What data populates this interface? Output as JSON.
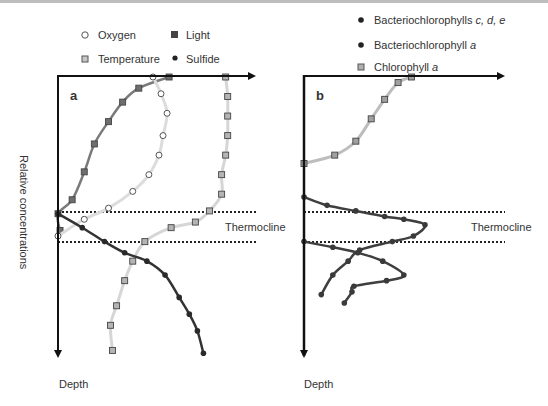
{
  "chart_data": [
    {
      "type": "line",
      "panel_label": "a",
      "xlabel": "Relative concentrations",
      "ylabel": "Depth",
      "annotation": "Thermocline",
      "thermocline_depth_range": [
        0.49,
        0.59
      ],
      "x_range": [
        0,
        1
      ],
      "y_range": [
        0,
        1
      ],
      "legend": [
        {
          "name": "Oxygen",
          "marker": "open-circle"
        },
        {
          "name": "Light",
          "marker": "filled-square"
        },
        {
          "name": "Temperature",
          "marker": "light-square"
        },
        {
          "name": "Sulfide",
          "marker": "filled-circle"
        }
      ],
      "series": [
        {
          "name": "Light",
          "color": "#6e6e6e",
          "line_color": "#7a7a7a",
          "marker": "filled-square",
          "points": [
            [
              0.55,
              0.0
            ],
            [
              0.4,
              0.04
            ],
            [
              0.32,
              0.09
            ],
            [
              0.25,
              0.16
            ],
            [
              0.18,
              0.24
            ],
            [
              0.13,
              0.34
            ],
            [
              0.07,
              0.44
            ],
            [
              0.0,
              0.49
            ],
            [
              0.01,
              0.55
            ]
          ]
        },
        {
          "name": "Oxygen",
          "color": "#ffffff",
          "line_color": "#dcdcdc",
          "marker": "open-circle",
          "points": [
            [
              0.47,
              0.0
            ],
            [
              0.51,
              0.06
            ],
            [
              0.54,
              0.13
            ],
            [
              0.52,
              0.21
            ],
            [
              0.5,
              0.28
            ],
            [
              0.45,
              0.35
            ],
            [
              0.37,
              0.41
            ],
            [
              0.25,
              0.47
            ],
            [
              0.13,
              0.51
            ],
            [
              0.0,
              0.57
            ]
          ]
        },
        {
          "name": "Temperature",
          "color": "#b4b4b4",
          "line_color": "#d6d6d6",
          "marker": "light-square",
          "points": [
            [
              0.83,
              0.0
            ],
            [
              0.84,
              0.07
            ],
            [
              0.84,
              0.14
            ],
            [
              0.84,
              0.21
            ],
            [
              0.83,
              0.28
            ],
            [
              0.81,
              0.35
            ],
            [
              0.81,
              0.42
            ],
            [
              0.75,
              0.48
            ],
            [
              0.68,
              0.52
            ],
            [
              0.56,
              0.54
            ],
            [
              0.43,
              0.59
            ],
            [
              0.37,
              0.66
            ],
            [
              0.33,
              0.73
            ],
            [
              0.29,
              0.82
            ],
            [
              0.26,
              0.89
            ],
            [
              0.27,
              0.98
            ]
          ]
        },
        {
          "name": "Sulfide",
          "color": "#2a2a2a",
          "line_color": "#333333",
          "marker": "filled-circle",
          "points": [
            [
              0.0,
              0.49
            ],
            [
              0.12,
              0.54
            ],
            [
              0.23,
              0.59
            ],
            [
              0.33,
              0.63
            ],
            [
              0.44,
              0.66
            ],
            [
              0.53,
              0.71
            ],
            [
              0.6,
              0.79
            ],
            [
              0.65,
              0.85
            ],
            [
              0.69,
              0.91
            ],
            [
              0.72,
              0.99
            ]
          ]
        }
      ]
    },
    {
      "type": "line",
      "panel_label": "b",
      "xlabel": "",
      "ylabel": "Depth",
      "annotation": "Thermocline",
      "thermocline_depth_range": [
        0.49,
        0.59
      ],
      "x_range": [
        0,
        1
      ],
      "y_range": [
        0,
        1
      ],
      "legend": [
        {
          "name": "Bacteriochlorophylls c, d, e",
          "plain": "Bacteriochlorophylls ",
          "italic": "c, d, e",
          "marker": "filled-circle"
        },
        {
          "name": "Bacteriochlorophyll a",
          "plain": "Bacteriochlorophyll ",
          "italic": "a",
          "marker": "filled-circle"
        },
        {
          "name": "Chlorophyll a",
          "plain": "Chlorophyll ",
          "italic": "a",
          "marker": "light-square"
        }
      ],
      "series": [
        {
          "name": "Chlorophyll a",
          "color": "#a0a0a0",
          "line_color": "#bdbdbd",
          "marker": "light-square",
          "points": [
            [
              0.0,
              0.31
            ],
            [
              0.16,
              0.28
            ],
            [
              0.27,
              0.23
            ],
            [
              0.35,
              0.15
            ],
            [
              0.42,
              0.08
            ],
            [
              0.49,
              0.02
            ],
            [
              0.56,
              0.0
            ]
          ]
        },
        {
          "name": "Bacteriochlorophylls c, d, e",
          "color": "#3a3a3a",
          "line_color": "#3f3f3f",
          "marker": "filled-circle",
          "points": [
            [
              0.0,
              0.43
            ],
            [
              0.12,
              0.46
            ],
            [
              0.27,
              0.48
            ],
            [
              0.42,
              0.5
            ],
            [
              0.52,
              0.51
            ],
            [
              0.63,
              0.53
            ],
            [
              0.57,
              0.57
            ],
            [
              0.46,
              0.59
            ],
            [
              0.29,
              0.62
            ],
            [
              0.23,
              0.66
            ],
            [
              0.15,
              0.71
            ],
            [
              0.09,
              0.78
            ]
          ]
        },
        {
          "name": "Bacteriochlorophyll a",
          "color": "#3a3a3a",
          "line_color": "#3f3f3f",
          "marker": "filled-circle",
          "points": [
            [
              0.0,
              0.59
            ],
            [
              0.15,
              0.61
            ],
            [
              0.28,
              0.63
            ],
            [
              0.41,
              0.66
            ],
            [
              0.52,
              0.71
            ],
            [
              0.43,
              0.73
            ],
            [
              0.26,
              0.75
            ],
            [
              0.25,
              0.77
            ],
            [
              0.21,
              0.81
            ]
          ]
        }
      ]
    }
  ],
  "labels": {
    "panel_a": "a",
    "panel_b": "b",
    "y_axis_rotated": "Relative concentrations",
    "depth_a": "Depth",
    "depth_b": "Depth",
    "thermocline_a": "Thermocline",
    "thermocline_b": "Thermocline"
  },
  "legend_a": {
    "oxygen": "Oxygen",
    "light": "Light",
    "temperature": "Temperature",
    "sulfide": "Sulfide"
  },
  "legend_b": {
    "bchl_cde_plain": "Bacteriochlorophylls ",
    "bchl_cde_italic": "c, d, e",
    "bchl_a_plain": "Bacteriochlorophyll ",
    "bchl_a_italic": "a",
    "chl_a_plain": "Chlorophyll ",
    "chl_a_italic": "a"
  }
}
